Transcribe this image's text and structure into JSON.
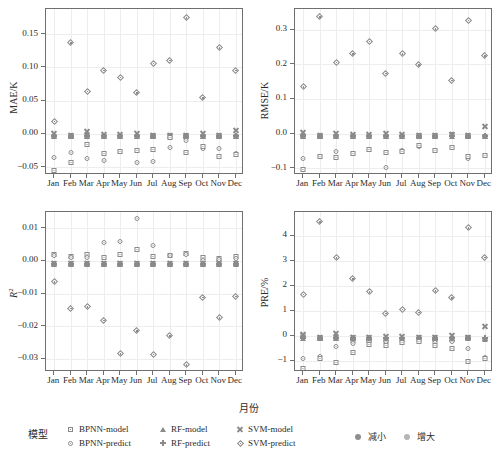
{
  "figure": {
    "x_caption": "月份",
    "months": [
      "Jan",
      "Feb",
      "Mar",
      "Apr",
      "May",
      "Jun",
      "Jul",
      "Aug",
      "Sep",
      "Oct",
      "Nov",
      "Dec"
    ]
  },
  "legend": {
    "title": "模型",
    "items": [
      {
        "label": "BPNN-model",
        "marker": "square"
      },
      {
        "label": "RF-model",
        "marker": "triangle"
      },
      {
        "label": "SVM-model",
        "marker": "cross"
      },
      {
        "label": "BPNN-predict",
        "marker": "circle"
      },
      {
        "label": "RF-predict",
        "marker": "plus"
      },
      {
        "label": "SVM-predict",
        "marker": "diamond"
      }
    ],
    "direction": [
      {
        "label": "减小",
        "color": "#8e8e8e"
      },
      {
        "label": "增大",
        "color": "#b5b5b5"
      }
    ]
  },
  "chart_data": [
    {
      "type": "scatter",
      "id": "mae",
      "title": "",
      "xlabel": "月份",
      "ylabel": "MAE/K",
      "categories": [
        "Jan",
        "Feb",
        "Mar",
        "Apr",
        "May",
        "Jun",
        "Jul",
        "Aug",
        "Sep",
        "Oct",
        "Nov",
        "Dec"
      ],
      "ylim": [
        -0.062,
        0.188
      ],
      "yticks": [
        -0.05,
        0.0,
        0.05,
        0.1,
        0.15
      ],
      "ytick_labels": [
        "−0.05",
        "0.00",
        "0.05",
        "0.10",
        "0.15"
      ],
      "grid": true,
      "series": [
        {
          "name": "BPNN-model",
          "marker": "square",
          "values": [
            0.0,
            0.0,
            0.0,
            0.0,
            0.0,
            0.0,
            0.0,
            0.0,
            0.0,
            0.0,
            0.0,
            0.0
          ]
        },
        {
          "name": "RF-model",
          "marker": "triangle",
          "values": [
            0.0,
            0.0,
            0.0,
            0.0,
            0.0,
            0.0,
            0.0,
            0.0,
            0.0,
            0.0,
            0.0,
            0.0
          ]
        },
        {
          "name": "SVM-model",
          "marker": "cross",
          "values": [
            0.003,
            0.0,
            0.006,
            0.002,
            0.002,
            0.003,
            0.0,
            0.0,
            0.0,
            0.004,
            0.0,
            0.008
          ]
        },
        {
          "name": "BPNN-predict",
          "marker": "circle",
          "values": [
            -0.032,
            -0.024,
            -0.034,
            -0.037,
            -0.023,
            -0.04,
            -0.038,
            -0.017,
            -0.006,
            -0.018,
            -0.019,
            -0.026
          ]
        },
        {
          "name": "RF-predict",
          "marker": "plus",
          "values": [
            0.0,
            0.0,
            0.0,
            0.0,
            0.0,
            0.0,
            0.0,
            0.0,
            0.0,
            0.0,
            0.0,
            0.0
          ]
        },
        {
          "name": "SVM-predict",
          "marker": "diamond",
          "values": [
            0.022,
            0.14,
            0.067,
            0.099,
            0.088,
            0.065,
            0.109,
            0.114,
            0.178,
            0.057,
            0.133,
            0.099
          ]
        },
        {
          "name": "BPNN-model-2",
          "marker": "square",
          "values": [
            -0.051,
            -0.039,
            -0.012,
            -0.026,
            -0.023,
            -0.022,
            -0.02,
            -0.002,
            -0.024,
            -0.015,
            -0.031,
            -0.028
          ]
        }
      ]
    },
    {
      "type": "scatter",
      "id": "rmse",
      "title": "",
      "xlabel": "月份",
      "ylabel": "RMSE/K",
      "categories": [
        "Jan",
        "Feb",
        "Mar",
        "Apr",
        "May",
        "Jun",
        "Jul",
        "Aug",
        "Sep",
        "Oct",
        "Nov",
        "Dec"
      ],
      "ylim": [
        -0.12,
        0.36
      ],
      "yticks": [
        -0.1,
        0.0,
        0.1,
        0.2,
        0.3
      ],
      "ytick_labels": [
        "−0.1",
        "0.0",
        "0.1",
        "0.2",
        "0.3"
      ],
      "grid": true,
      "series": [
        {
          "name": "BPNN-model",
          "marker": "square",
          "values": [
            0.0,
            0.0,
            0.0,
            0.0,
            0.0,
            0.0,
            0.0,
            0.0,
            0.0,
            0.004,
            0.0,
            0.0
          ]
        },
        {
          "name": "RF-model",
          "marker": "triangle",
          "values": [
            0.0,
            0.0,
            0.0,
            0.0,
            0.0,
            0.0,
            0.0,
            0.0,
            0.0,
            0.0,
            0.0,
            0.0
          ]
        },
        {
          "name": "SVM-model",
          "marker": "cross",
          "values": [
            0.008,
            0.0,
            0.006,
            0.003,
            0.002,
            0.006,
            0.003,
            0.0,
            0.0,
            0.004,
            0.0,
            0.026
          ]
        },
        {
          "name": "BPNN-predict",
          "marker": "circle",
          "values": [
            -0.066,
            -0.06,
            -0.045,
            -0.052,
            -0.039,
            -0.09,
            -0.043,
            -0.029,
            -0.041,
            -0.033,
            -0.065,
            -0.057
          ]
        },
        {
          "name": "RF-predict",
          "marker": "plus",
          "values": [
            0.0,
            0.0,
            0.0,
            0.0,
            0.0,
            0.0,
            0.0,
            0.0,
            0.0,
            0.0,
            0.0,
            0.0
          ]
        },
        {
          "name": "SVM-predict",
          "marker": "diamond",
          "values": [
            0.141,
            0.343,
            0.212,
            0.236,
            0.272,
            0.18,
            0.236,
            0.204,
            0.308,
            0.16,
            0.333,
            0.231
          ]
        },
        {
          "name": "BPNN-model-2",
          "marker": "square",
          "values": [
            -0.097,
            -0.058,
            -0.062,
            -0.05,
            -0.038,
            -0.048,
            -0.044,
            -0.027,
            -0.041,
            -0.032,
            -0.059,
            -0.056
          ]
        }
      ]
    },
    {
      "type": "scatter",
      "id": "r2",
      "title": "",
      "xlabel": "月份",
      "ylabel": "R2",
      "categories": [
        "Jan",
        "Feb",
        "Mar",
        "Apr",
        "May",
        "Jun",
        "Jul",
        "Aug",
        "Sep",
        "Oct",
        "Nov",
        "Dec"
      ],
      "ylim": [
        -0.034,
        0.015
      ],
      "yticks": [
        -0.03,
        -0.02,
        -0.01,
        0.0,
        0.01
      ],
      "ytick_labels": [
        "−0.03",
        "−0.02",
        "−0.01",
        "0.00",
        "0.01"
      ],
      "grid": true,
      "series": [
        {
          "name": "BPNN-model",
          "marker": "square",
          "values": [
            0.0026,
            0.0022,
            0.0028,
            0.0017,
            0.0026,
            0.0042,
            0.002,
            0.0024,
            0.003,
            0.0018,
            0.0016,
            0.0022
          ]
        },
        {
          "name": "RF-model",
          "marker": "triangle",
          "values": [
            -0.0004,
            -0.0004,
            -0.0004,
            -0.0004,
            -0.0004,
            -0.0004,
            -0.0004,
            -0.0004,
            -0.0004,
            -0.0004,
            -0.0004,
            -0.0004
          ]
        },
        {
          "name": "SVM-model",
          "marker": "cross",
          "values": [
            -0.0003,
            -0.0003,
            -0.0003,
            -0.0003,
            -0.0003,
            -0.0003,
            -0.0003,
            -0.0003,
            -0.0003,
            -0.0003,
            -0.0003,
            -0.0003
          ]
        },
        {
          "name": "BPNN-predict",
          "marker": "circle",
          "values": [
            0.0024,
            0.0018,
            0.0017,
            0.0065,
            0.0066,
            0.0137,
            0.0055,
            0.0024,
            0.0026,
            0.001,
            0.0012,
            0.0016
          ]
        },
        {
          "name": "RF-predict",
          "marker": "plus",
          "values": [
            -0.0004,
            -0.0004,
            -0.0004,
            -0.0004,
            -0.0004,
            -0.0004,
            -0.0004,
            -0.0004,
            -0.0004,
            -0.0004,
            -0.0004,
            -0.0004
          ]
        },
        {
          "name": "SVM-predict",
          "marker": "diamond",
          "values": [
            -0.0058,
            -0.0139,
            -0.0134,
            -0.0175,
            -0.0278,
            -0.0207,
            -0.0279,
            -0.0223,
            -0.0312,
            -0.0105,
            -0.0167,
            -0.0102
          ]
        }
      ]
    },
    {
      "type": "scatter",
      "id": "pre",
      "title": "",
      "xlabel": "月份",
      "ylabel": "PRE/%",
      "categories": [
        "Jan",
        "Feb",
        "Mar",
        "Apr",
        "May",
        "Jun",
        "Jul",
        "Aug",
        "Sep",
        "Oct",
        "Nov",
        "Dec"
      ],
      "ylim": [
        -1.45,
        4.95
      ],
      "yticks": [
        -1,
        0,
        1,
        2,
        3,
        4
      ],
      "ytick_labels": [
        "−1",
        "0",
        "1",
        "2",
        "3",
        "4"
      ],
      "grid": true,
      "series": [
        {
          "name": "BPNN-model",
          "marker": "square",
          "values": [
            0.1,
            -0.02,
            0.0,
            -0.1,
            -0.08,
            -0.07,
            -0.04,
            -0.05,
            -0.06,
            -0.05,
            0.02,
            -0.05
          ]
        },
        {
          "name": "RF-model",
          "marker": "triangle",
          "values": [
            0.0,
            0.0,
            0.0,
            0.0,
            0.0,
            0.0,
            0.0,
            0.0,
            0.0,
            0.0,
            0.0,
            0.0
          ]
        },
        {
          "name": "SVM-model",
          "marker": "cross",
          "values": [
            0.12,
            0.0,
            0.16,
            0.02,
            0.02,
            0.05,
            0.04,
            0.0,
            0.0,
            0.1,
            0.0,
            0.45
          ]
        },
        {
          "name": "BPNN-predict",
          "marker": "circle",
          "values": [
            -0.79,
            -0.72,
            -0.34,
            -0.21,
            -0.14,
            -0.12,
            -0.12,
            -0.1,
            -0.16,
            -0.12,
            -0.41,
            -0.76
          ]
        },
        {
          "name": "RF-predict",
          "marker": "plus",
          "values": [
            0.0,
            0.0,
            0.0,
            0.0,
            0.0,
            0.0,
            0.0,
            0.0,
            0.0,
            0.0,
            0.0,
            0.0
          ]
        },
        {
          "name": "SVM-predict",
          "marker": "diamond",
          "values": [
            1.74,
            4.65,
            3.2,
            2.36,
            1.85,
            0.99,
            1.15,
            1.03,
            1.88,
            1.6,
            4.4,
            3.22
          ]
        },
        {
          "name": "BPNN-model-2",
          "marker": "square",
          "values": [
            -1.21,
            -0.79,
            -0.97,
            -0.57,
            -0.25,
            -0.3,
            -0.18,
            -0.14,
            -0.27,
            -0.41,
            -0.91,
            -0.82
          ]
        }
      ]
    }
  ]
}
